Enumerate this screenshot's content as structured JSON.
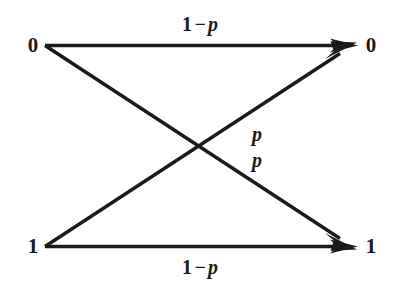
{
  "diagram": {
    "stroke_color": "#1b1b1b",
    "background_color": "#ffffff",
    "input_nodes": [
      {
        "id": "in-0",
        "label": "0",
        "x": 45,
        "y": 45
      },
      {
        "id": "in-1",
        "label": "1",
        "x": 45,
        "y": 246
      }
    ],
    "output_nodes": [
      {
        "id": "out-0",
        "label": "0",
        "x": 358,
        "y": 45
      },
      {
        "id": "out-1",
        "label": "1",
        "x": 358,
        "y": 246
      }
    ],
    "edges": [
      {
        "id": "edge-0-0",
        "from": "in-0",
        "to": "out-0",
        "label_parts": {
          "lead": "1",
          "operator": "−",
          "symbol": "p"
        },
        "label_text": "1 − p"
      },
      {
        "id": "edge-0-1",
        "from": "in-0",
        "to": "out-1",
        "label_parts": {
          "lead": "",
          "operator": "",
          "symbol": "p"
        },
        "label_text": "p"
      },
      {
        "id": "edge-1-0",
        "from": "in-1",
        "to": "out-0",
        "label_parts": {
          "lead": "",
          "operator": "",
          "symbol": "p"
        },
        "label_text": "p"
      },
      {
        "id": "edge-1-1",
        "from": "in-1",
        "to": "out-1",
        "label_parts": {
          "lead": "1",
          "operator": "−",
          "symbol": "p"
        },
        "label_text": "1 − p"
      }
    ],
    "labels": {
      "top_transition": {
        "lead": "1",
        "operator": "−",
        "symbol": "p"
      },
      "bottom_transition": {
        "lead": "1",
        "operator": "−",
        "symbol": "p"
      },
      "cross_upper": {
        "symbol": "p"
      },
      "cross_lower": {
        "symbol": "p"
      }
    },
    "crossing_point": {
      "x": 201,
      "y": 145
    }
  }
}
